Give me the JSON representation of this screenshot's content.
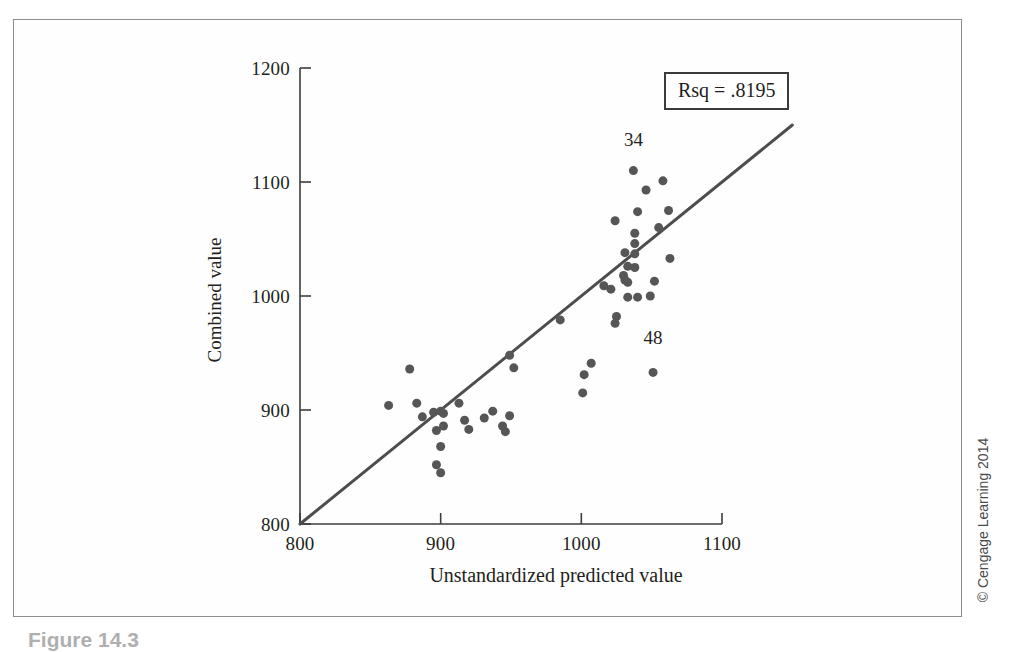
{
  "figure": {
    "caption": "Figure 14.3",
    "copyright": "© Cengage Learning 2014"
  },
  "annotations": {
    "rsq_label": "Rsq = .8195",
    "point_labels": [
      {
        "text": "34",
        "x": 1037,
        "y": 1121
      },
      {
        "text": "48",
        "x": 1051,
        "y": 947
      }
    ]
  },
  "chart_data": {
    "type": "scatter",
    "title": "",
    "xlabel": "Unstandardized predicted value",
    "ylabel": "Combined value",
    "xlim": [
      800,
      1100
    ],
    "ylim": [
      800,
      1200
    ],
    "xticks": [
      800,
      900,
      1000,
      1100
    ],
    "yticks": [
      800,
      900,
      1000,
      1100,
      1200
    ],
    "xticklabels": [
      "800",
      "900",
      "1000",
      "1100"
    ],
    "yticklabels": [
      "800",
      "900",
      "1000",
      "1100",
      "1200"
    ],
    "grid": false,
    "legend": false,
    "r_squared": 0.8195,
    "marker_color": "#565656",
    "marker_size": 9,
    "fit_line": {
      "label": "regression line",
      "color": "#4d4d4d",
      "width": 3,
      "x": [
        800,
        1150
      ],
      "y": [
        800,
        1150
      ]
    },
    "points": [
      {
        "x": 878,
        "y": 936
      },
      {
        "x": 863,
        "y": 904
      },
      {
        "x": 883,
        "y": 906
      },
      {
        "x": 887,
        "y": 894
      },
      {
        "x": 895,
        "y": 898
      },
      {
        "x": 900,
        "y": 899
      },
      {
        "x": 902,
        "y": 897
      },
      {
        "x": 913,
        "y": 906
      },
      {
        "x": 902,
        "y": 886
      },
      {
        "x": 897,
        "y": 882
      },
      {
        "x": 917,
        "y": 891
      },
      {
        "x": 920,
        "y": 883
      },
      {
        "x": 937,
        "y": 899
      },
      {
        "x": 900,
        "y": 868
      },
      {
        "x": 897,
        "y": 852
      },
      {
        "x": 900,
        "y": 845
      },
      {
        "x": 949,
        "y": 948
      },
      {
        "x": 952,
        "y": 937
      },
      {
        "x": 1007,
        "y": 941
      },
      {
        "x": 1002,
        "y": 931
      },
      {
        "x": 1001,
        "y": 915
      },
      {
        "x": 931,
        "y": 893
      },
      {
        "x": 949,
        "y": 895
      },
      {
        "x": 944,
        "y": 886
      },
      {
        "x": 946,
        "y": 881
      },
      {
        "x": 985,
        "y": 979
      },
      {
        "x": 1016,
        "y": 1009
      },
      {
        "x": 1031,
        "y": 1038
      },
      {
        "x": 1024,
        "y": 976
      },
      {
        "x": 1025,
        "y": 982
      },
      {
        "x": 1037,
        "y": 1110
      },
      {
        "x": 1046,
        "y": 1093
      },
      {
        "x": 1040,
        "y": 1074
      },
      {
        "x": 1024,
        "y": 1066
      },
      {
        "x": 1038,
        "y": 1055
      },
      {
        "x": 1055,
        "y": 1060
      },
      {
        "x": 1038,
        "y": 1046
      },
      {
        "x": 1038,
        "y": 1037
      },
      {
        "x": 1033,
        "y": 1026
      },
      {
        "x": 1038,
        "y": 1025
      },
      {
        "x": 1030,
        "y": 1018
      },
      {
        "x": 1031,
        "y": 1014
      },
      {
        "x": 1033,
        "y": 1012
      },
      {
        "x": 1021,
        "y": 1006
      },
      {
        "x": 1052,
        "y": 1013
      },
      {
        "x": 1033,
        "y": 999
      },
      {
        "x": 1040,
        "y": 999
      },
      {
        "x": 1049,
        "y": 1000
      },
      {
        "x": 1058,
        "y": 1101
      },
      {
        "x": 1062,
        "y": 1075
      },
      {
        "x": 1063,
        "y": 1033
      },
      {
        "x": 1051,
        "y": 933
      }
    ]
  }
}
